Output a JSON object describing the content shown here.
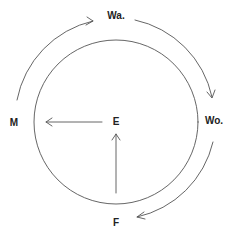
{
  "diagram": {
    "type": "cycle",
    "nodes": {
      "top": {
        "label": "Wa."
      },
      "right": {
        "label": "Wo."
      },
      "bottom": {
        "label": "F"
      },
      "left": {
        "label": "M"
      },
      "center": {
        "label": "E"
      }
    },
    "edges": [
      {
        "from": "M",
        "to": "Wa.",
        "style": "outer-arc-clockwise"
      },
      {
        "from": "Wa.",
        "to": "Wo.",
        "style": "outer-arc-clockwise"
      },
      {
        "from": "Wo.",
        "to": "F",
        "style": "outer-arc-clockwise"
      },
      {
        "from": "E",
        "to": "M",
        "style": "straight-arrow"
      },
      {
        "from": "F",
        "to": "E",
        "style": "straight-arrow"
      }
    ],
    "colors": {
      "stroke": "#555555",
      "text": "#222222",
      "background": "#ffffff"
    }
  }
}
